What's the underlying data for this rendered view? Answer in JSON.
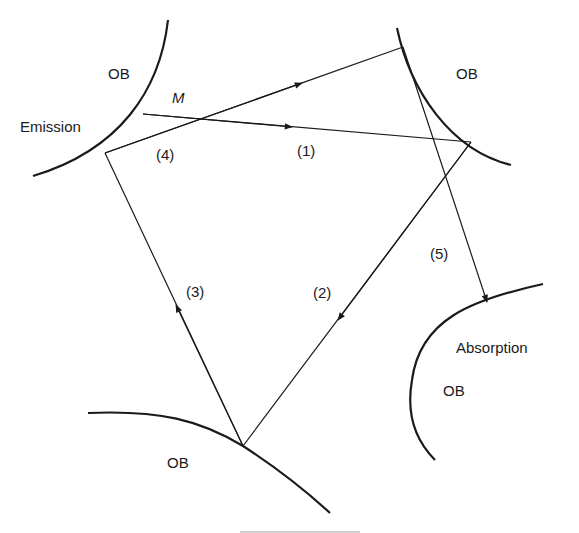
{
  "diagram": {
    "regions": [
      {
        "id": "ob-emission",
        "label": "OB",
        "sublabel": "Emission"
      },
      {
        "id": "ob-top-right",
        "label": "OB"
      },
      {
        "id": "ob-bottom",
        "label": "OB"
      },
      {
        "id": "ob-absorption",
        "label": "OB",
        "sublabel": "Absorption"
      }
    ],
    "point_label": "M",
    "paths": [
      {
        "id": "path-1",
        "label": "(1)",
        "from": "M on emission surface",
        "to": "top-right OB"
      },
      {
        "id": "path-2",
        "label": "(2)",
        "from": "top-right OB",
        "to": "bottom OB"
      },
      {
        "id": "path-3",
        "label": "(3)",
        "from": "bottom OB",
        "to": "emission OB"
      },
      {
        "id": "path-4",
        "label": "(4)",
        "from": "emission OB",
        "to": "top-right OB"
      },
      {
        "id": "path-5",
        "label": "(5)",
        "from": "top-right OB",
        "to": "absorption OB"
      }
    ],
    "colors": {
      "stroke": "#1a1a1a",
      "background": "#ffffff"
    }
  }
}
